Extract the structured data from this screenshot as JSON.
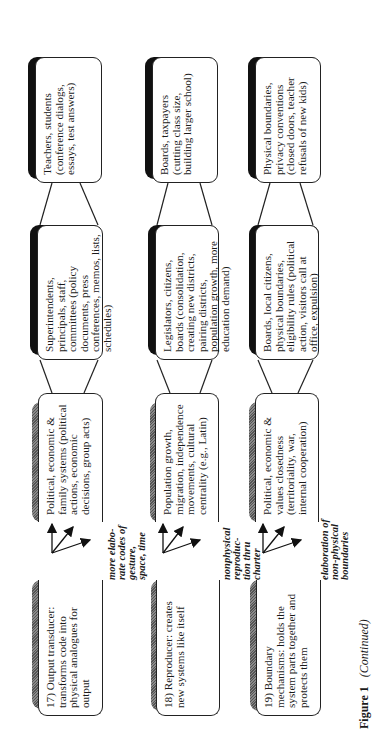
{
  "figure": {
    "label": "Figure 1",
    "continued": "(Continued)",
    "orientation": "rotated 90 degrees counter-clockwise"
  },
  "rows": [
    {
      "id": "17",
      "label": "17) Output transducer: transforms code into physical analogues for output",
      "arrow_note": "more elabo-rate codes of gesture, space, time",
      "levels": [
        "Political, economic & family systems (political actions, economic decisions, group acts)",
        "Superintendents, principals, staff, committees (policy documents, press conferences, memos, lists, schedules)",
        "Teachers, students (conference dialogs, essays, test answers)"
      ]
    },
    {
      "id": "18",
      "label": "18) Reproducer: creates new systems like itself",
      "arrow_note": "nonphysical reproduc-tion thru charter",
      "levels": [
        "Population growth, migration, independence movements, cultural centrality (e.g., Latin)",
        "Legislators, citizens, boards (consolidation, creating new districts, pairing districts, population growth, more education demand)",
        "Boards, taxpayers (cutting class size, building larger school)"
      ]
    },
    {
      "id": "19",
      "label": "19) Boundary mechanisms: holds the system parts together and protects them",
      "arrow_note": "elaboration of non-physical boundaries",
      "levels": [
        "Political, economic & values closedness (territoriality, war, internal cooperation)",
        "Boards, local citizens, physical boundaries, eligibility rules (political action, visitors call at office, expulsion)",
        "Physical boundaries, privacy conventions (closed doors, teacher refusals of new kids)"
      ]
    }
  ]
}
